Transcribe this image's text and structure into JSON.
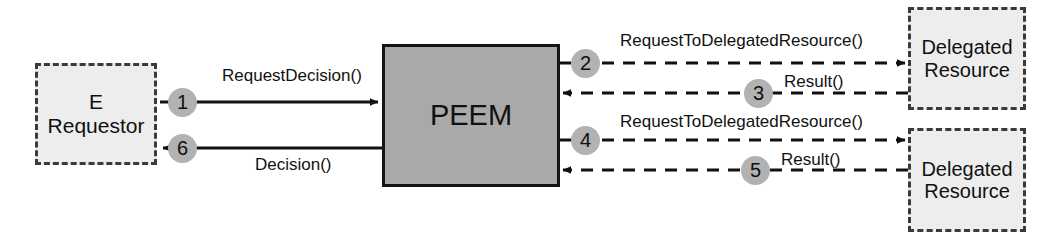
{
  "diagram": {
    "colors": {
      "dashed_node_fill": "#ededed",
      "dashed_node_border": "#3a3a3a",
      "solid_node_fill": "#a9a9a9",
      "solid_node_border": "#141414",
      "sequence_circle_fill": "#b2b2b2",
      "line": "#111111",
      "background": "#ffffff",
      "text": "#111111"
    },
    "nodes": [
      {
        "id": "e-requestor",
        "label_lines": [
          "E",
          "Requestor"
        ],
        "style": "dashed",
        "x": 35,
        "y": 63,
        "w": 122,
        "h": 102
      },
      {
        "id": "peem",
        "label_lines": [
          "PEEM"
        ],
        "style": "solid",
        "x": 382,
        "y": 44,
        "w": 178,
        "h": 143
      },
      {
        "id": "delegated-resource-1",
        "label_lines": [
          "Delegated",
          "Resource"
        ],
        "style": "dashed",
        "x": 908,
        "y": 7,
        "w": 118,
        "h": 103
      },
      {
        "id": "delegated-resource-2",
        "label_lines": [
          "Delegated",
          "Resource"
        ],
        "style": "dashed",
        "x": 908,
        "y": 128,
        "w": 118,
        "h": 104
      }
    ],
    "messages": [
      {
        "seq": "1",
        "label": "RequestDecision()",
        "from": "e-requestor",
        "to": "peem",
        "line_style": "solid",
        "direction": "right"
      },
      {
        "seq": "2",
        "label": "RequestToDelegatedResource()",
        "from": "peem",
        "to": "delegated-resource-1",
        "line_style": "dashed",
        "direction": "right"
      },
      {
        "seq": "3",
        "label": "Result()",
        "from": "delegated-resource-1",
        "to": "peem",
        "line_style": "dashed",
        "direction": "left"
      },
      {
        "seq": "4",
        "label": "RequestToDelegatedResource()",
        "from": "peem",
        "to": "delegated-resource-2",
        "line_style": "dashed",
        "direction": "right"
      },
      {
        "seq": "5",
        "label": "Result()",
        "from": "delegated-resource-2",
        "to": "peem",
        "line_style": "dashed",
        "direction": "left"
      },
      {
        "seq": "6",
        "label": "Decision()",
        "from": "peem",
        "to": "e-requestor",
        "line_style": "solid",
        "direction": "left"
      }
    ]
  }
}
